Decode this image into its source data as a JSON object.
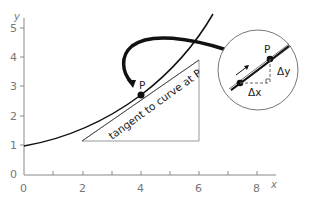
{
  "diagram": {
    "axes": {
      "x_label": "x",
      "y_label": "y",
      "x_ticks": [
        "0",
        "2",
        "4",
        "6",
        "8"
      ],
      "y_ticks": [
        "0",
        "1",
        "2",
        "3",
        "4",
        "5"
      ]
    },
    "point_label": "P",
    "tangent_label": "tangent to curve at P",
    "inset": {
      "point_label": "P",
      "delta_x": "Δx",
      "delta_y": "Δy"
    }
  }
}
